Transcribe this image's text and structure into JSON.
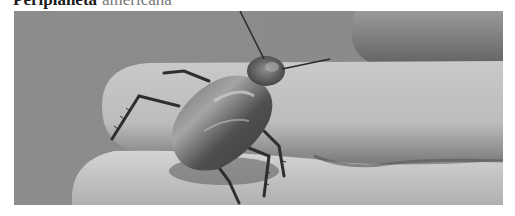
{
  "caption": {
    "genus": "Periplaneta",
    "species": "americana"
  },
  "photo": {
    "subject": "cockroach-on-fingers",
    "alt": "American cockroach resting on a person's fingers",
    "tone": "grayscale",
    "colors": {
      "background": "#8a8a8a",
      "skin_light": "#d2d2d2",
      "skin_mid": "#b5b5b5",
      "skin_shadow": "#6a6a6a",
      "insect_body": "#4a4a4a",
      "insect_highlight": "#9a9a9a",
      "insect_dark": "#2a2a2a"
    }
  }
}
